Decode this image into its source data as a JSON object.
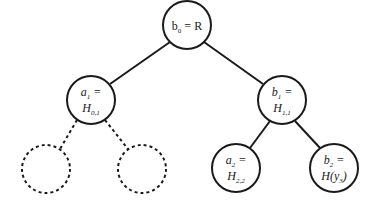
{
  "diagram": {
    "type": "binary-tree",
    "nodes": [
      {
        "id": "root",
        "label": "b0 = R",
        "line1_main": "b",
        "line1_sub": "0",
        "line1_rest": " = R",
        "cx": 187,
        "cy": 25,
        "r": 24,
        "style": "solid"
      },
      {
        "id": "a1",
        "line1_main": "a",
        "line1_sub": "1",
        "line1_rest": " =",
        "line2_main": "H",
        "line2_sub": "0,1",
        "line2_rest": "",
        "cx": 91,
        "cy": 100,
        "r": 24,
        "style": "solid"
      },
      {
        "id": "b1",
        "line1_main": "b",
        "line1_sub": "1",
        "line1_rest": " =",
        "line2_main": "H",
        "line2_sub": "1,1",
        "line2_rest": "",
        "cx": 282,
        "cy": 100,
        "r": 24,
        "style": "solid"
      },
      {
        "id": "dashed-left",
        "cx": 46,
        "cy": 169,
        "r": 24,
        "style": "dashed"
      },
      {
        "id": "dashed-right",
        "cx": 142,
        "cy": 169,
        "r": 24,
        "style": "dashed"
      },
      {
        "id": "a2",
        "line1_main": "a",
        "line1_sub": "2",
        "line1_rest": " =",
        "line2_main": "H",
        "line2_sub": "2,2",
        "line2_rest": "",
        "cx": 236,
        "cy": 168,
        "r": 24,
        "style": "solid"
      },
      {
        "id": "b2",
        "line1_main": "b",
        "line1_sub": "2",
        "line1_rest": " =",
        "line2_main": "H(y",
        "line2_sub": "3",
        "line2_rest": ")",
        "cx": 334,
        "cy": 168,
        "r": 24,
        "style": "solid"
      }
    ],
    "edges": [
      {
        "from": "root",
        "to": "a1",
        "style": "solid"
      },
      {
        "from": "root",
        "to": "b1",
        "style": "solid"
      },
      {
        "from": "a1",
        "to": "dashed-left",
        "style": "dashed"
      },
      {
        "from": "a1",
        "to": "dashed-right",
        "style": "dashed"
      },
      {
        "from": "b1",
        "to": "a2",
        "style": "solid"
      },
      {
        "from": "b1",
        "to": "b2",
        "style": "solid"
      }
    ]
  },
  "labels": {
    "root": {
      "main": "b",
      "sub": "0",
      "rest": " = R"
    },
    "a1": {
      "l1_main": "a",
      "l1_sub": "1",
      "l1_rest": " =",
      "l2_main": "H",
      "l2_sub": "0,1"
    },
    "b1": {
      "l1_main": "b",
      "l1_sub": "1",
      "l1_rest": " =",
      "l2_main": "H",
      "l2_sub": "1,1"
    },
    "a2": {
      "l1_main": "a",
      "l1_sub": "2",
      "l1_rest": " =",
      "l2_main": "H",
      "l2_sub": "2,2"
    },
    "b2": {
      "l1_main": "b",
      "l1_sub": "2",
      "l1_rest": " =",
      "l2_main": "H(y",
      "l2_sub": "3",
      "l2_rest": ")"
    }
  }
}
